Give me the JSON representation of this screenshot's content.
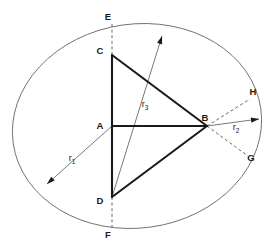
{
  "figure": {
    "title": "",
    "background_color": "#ffffff",
    "stroke_color": "#1a1a1a",
    "thin_stroke_color": "#555555",
    "points": {
      "A": {
        "label": "A",
        "x": 112,
        "y": 126,
        "label_x": 100,
        "label_y": 129
      },
      "B": {
        "label": "B",
        "x": 207,
        "y": 126,
        "label_x": 205,
        "label_y": 121
      },
      "C": {
        "label": "C",
        "x": 112,
        "y": 55,
        "label_x": 100,
        "label_y": 54
      },
      "D": {
        "label": "D",
        "x": 112,
        "y": 197,
        "label_x": 100,
        "label_y": 204
      },
      "E": {
        "label": "E",
        "x": 112,
        "y": 24,
        "label_x": 108,
        "label_y": 20
      },
      "F": {
        "label": "F",
        "x": 112,
        "y": 228,
        "label_x": 108,
        "label_y": 238
      },
      "G": {
        "label": "G",
        "x": 248,
        "y": 155,
        "label_x": 251,
        "label_y": 161
      },
      "H": {
        "label": "H",
        "x": 250,
        "y": 97,
        "label_x": 253,
        "label_y": 95
      }
    },
    "radii": [
      {
        "name": "r1",
        "label": "r",
        "subscript": "1",
        "label_x": 72,
        "label_y": 161,
        "from_x": 112,
        "from_y": 126,
        "to_x": 47,
        "to_y": 184
      },
      {
        "name": "r2",
        "label": "r",
        "subscript": "2",
        "label_x": 236,
        "label_y": 130,
        "from_x": 207,
        "from_y": 126,
        "to_x": 259,
        "to_y": 119
      },
      {
        "name": "r3",
        "label": "r",
        "subscript": "3",
        "label_x": 145,
        "label_y": 107,
        "from_x": 112,
        "from_y": 197,
        "to_x": 162,
        "to_y": 36
      }
    ],
    "ellipse": {
      "cx": 137,
      "cy": 126,
      "rx": 125,
      "ry": 102,
      "rotation_deg": -8
    },
    "solid_segments": [
      {
        "name": "segment-C-A",
        "x1": 112,
        "y1": 55,
        "x2": 112,
        "y2": 126
      },
      {
        "name": "segment-A-D",
        "x1": 112,
        "y1": 126,
        "x2": 112,
        "y2": 197
      },
      {
        "name": "segment-A-B",
        "x1": 112,
        "y1": 126,
        "x2": 207,
        "y2": 126
      },
      {
        "name": "segment-C-B",
        "x1": 112,
        "y1": 55,
        "x2": 207,
        "y2": 126
      },
      {
        "name": "segment-B-D",
        "x1": 207,
        "y1": 126,
        "x2": 112,
        "y2": 197
      }
    ],
    "dashed_segments": [
      {
        "name": "axis-E-C",
        "x1": 112,
        "y1": 24,
        "x2": 112,
        "y2": 55
      },
      {
        "name": "axis-D-F",
        "x1": 112,
        "y1": 197,
        "x2": 112,
        "y2": 228
      },
      {
        "name": "chord-B-H",
        "x1": 207,
        "y1": 126,
        "x2": 250,
        "y2": 99
      },
      {
        "name": "chord-B-G",
        "x1": 207,
        "y1": 126,
        "x2": 248,
        "y2": 156
      }
    ]
  }
}
